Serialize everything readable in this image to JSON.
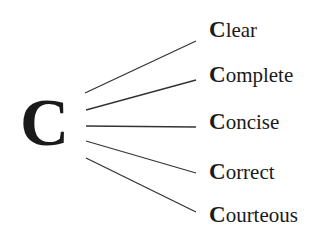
{
  "diagram": {
    "root": "C",
    "branches": [
      {
        "initial": "C",
        "rest": "lear",
        "word": "Clear"
      },
      {
        "initial": "C",
        "rest": "omplete",
        "word": "Complete"
      },
      {
        "initial": "C",
        "rest": "oncise",
        "word": "Concise"
      },
      {
        "initial": "C",
        "rest": "orrect",
        "word": "Correct"
      },
      {
        "initial": "C",
        "rest": "ourteous",
        "word": "Courteous"
      }
    ],
    "line_color": "#333333"
  }
}
